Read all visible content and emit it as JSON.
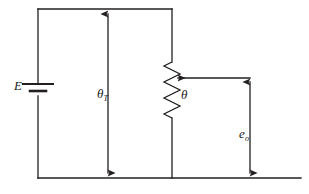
{
  "figure": {
    "kind": "circuit-diagram",
    "background_color": "#ffffff",
    "line_color": "#231f20",
    "text_color": "#1a1a1a",
    "line_width": 1.3
  },
  "labels": {
    "source": {
      "symbol": "E",
      "subscript": ""
    },
    "total_angle": {
      "symbol": "θ",
      "subscript": "T"
    },
    "wiper_angle": {
      "symbol": "θ",
      "subscript": ""
    },
    "output_voltage": {
      "symbol": "e",
      "subscript": "o"
    }
  },
  "components": {
    "battery": {
      "name": "battery",
      "orientation": "vertical",
      "x": 38,
      "y": 90
    },
    "potentiometer": {
      "name": "potentiometer",
      "orientation": "vertical",
      "x": 172,
      "top": 62,
      "bottom": 118,
      "zigzag_peaks": 7
    },
    "wiper": {
      "name": "wiper-arrow",
      "from_x": 250,
      "to_x": 176,
      "y": 78
    }
  },
  "dimension_arrows": {
    "theta_T": {
      "x": 108,
      "y_top": 10,
      "y_bottom": 178,
      "heads": "both"
    },
    "e_o": {
      "x": 250,
      "y_top": 78,
      "y_bottom": 178,
      "heads": "both"
    }
  },
  "wires": {
    "top_rail": {
      "x1": 38,
      "x2": 172,
      "y": 9
    },
    "bottom_rail": {
      "x1": 38,
      "x2": 301,
      "y": 178
    },
    "left_rail": {
      "x": 38,
      "y1": 9,
      "y2": 178
    },
    "pot_top_lead": {
      "x": 172,
      "y1": 9,
      "y2": 62
    },
    "pot_bottom_lead": {
      "x": 172,
      "y1": 118,
      "y2": 178
    },
    "wiper_lead": {
      "x1": 176,
      "x2": 250,
      "y": 78
    }
  }
}
